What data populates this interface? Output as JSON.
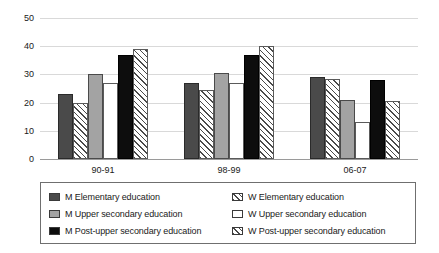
{
  "chart_data": {
    "type": "bar",
    "title": "",
    "subtitle": "",
    "xlabel": "",
    "ylabel": "",
    "categories": [
      "90-91",
      "98-99",
      "06-07"
    ],
    "ylim": [
      0,
      50
    ],
    "yticks": [
      0,
      10,
      20,
      30,
      40,
      50
    ],
    "grid": true,
    "legend_position": "bottom",
    "series": [
      {
        "name": "M Elementary education",
        "key": "m-elementary",
        "fill": "dark-gray",
        "color": "#4a4a4a",
        "values": [
          23,
          27,
          29
        ]
      },
      {
        "name": "W Elementary education",
        "key": "w-elementary",
        "fill": "hatch",
        "color": "#ffffff",
        "values": [
          20,
          24.5,
          28.5
        ]
      },
      {
        "name": "M Upper secondary education",
        "key": "m-upper-secondary",
        "fill": "mid-gray",
        "color": "#a3a3a3",
        "values": [
          30,
          30.5,
          21
        ]
      },
      {
        "name": "W Upper secondary education",
        "key": "w-upper-secondary",
        "fill": "white",
        "color": "#ffffff",
        "values": [
          27,
          27,
          13
        ]
      },
      {
        "name": "M Post-upper secondary education",
        "key": "m-post-upper",
        "fill": "black",
        "color": "#0d0d0d",
        "values": [
          37,
          37,
          28
        ]
      },
      {
        "name": "W Post-upper secondary education",
        "key": "w-post-upper",
        "fill": "hatch",
        "color": "#ffffff",
        "values": [
          39,
          40,
          20.5
        ]
      }
    ]
  },
  "axis": {
    "ytick_labels": [
      "0",
      "10",
      "20",
      "30",
      "40",
      "50"
    ],
    "xtick_labels": [
      "90-91",
      "98-99",
      "06-07"
    ]
  },
  "legend": {
    "entries": [
      {
        "label": "M Elementary education",
        "swatch": "dark-gray"
      },
      {
        "label": "W Elementary education",
        "swatch": "hatch"
      },
      {
        "label": "M Upper secondary education",
        "swatch": "mid-gray"
      },
      {
        "label": "W Upper secondary education",
        "swatch": "white"
      },
      {
        "label": "M Post-upper secondary education",
        "swatch": "black"
      },
      {
        "label": "W Post-upper secondary education",
        "swatch": "hatch"
      }
    ]
  }
}
